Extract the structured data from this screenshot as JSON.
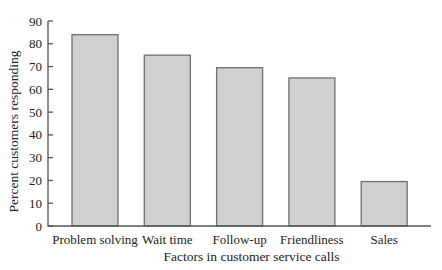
{
  "chart_data": {
    "type": "bar",
    "title": "",
    "xlabel": "Factors in customer service calls",
    "ylabel": "Percent customers responding",
    "categories": [
      "Problem solving",
      "Wait time",
      "Follow-up",
      "Friendliness",
      "Sales"
    ],
    "values": [
      84,
      75,
      69.5,
      65,
      19.5
    ],
    "ylim": [
      0,
      90
    ],
    "yticks": [
      0,
      10,
      20,
      30,
      40,
      50,
      60,
      70,
      80,
      90
    ],
    "grid": false,
    "legend": null,
    "colors": {
      "bar_fill": "#d0d0d0",
      "bar_stroke": "#6f6f6f",
      "axis": "#555555"
    }
  }
}
